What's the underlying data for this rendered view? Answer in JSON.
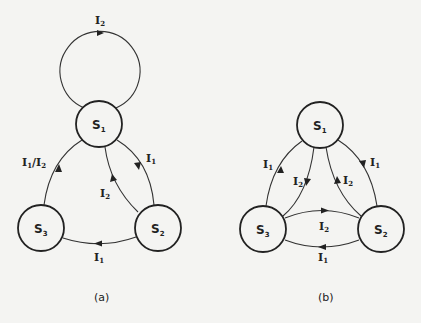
{
  "diagram_a": {
    "caption": "(a)",
    "states": [
      {
        "id": "S1",
        "base": "S",
        "sub": "1"
      },
      {
        "id": "S2",
        "base": "S",
        "sub": "2"
      },
      {
        "id": "S3",
        "base": "S",
        "sub": "3"
      }
    ],
    "transitions": [
      {
        "from": "S1",
        "to": "S1",
        "base": "I",
        "sub": "2",
        "label": "I2"
      },
      {
        "from": "S3",
        "to": "S1",
        "label": "I1/I2",
        "parts": [
          "I",
          "1",
          "/",
          "I",
          "2"
        ]
      },
      {
        "from": "S1",
        "to": "S2",
        "base": "I",
        "sub": "1",
        "label": "I1"
      },
      {
        "from": "S2",
        "to": "S1",
        "base": "I",
        "sub": "2",
        "label": "I2"
      },
      {
        "from": "S2",
        "to": "S3",
        "base": "I",
        "sub": "1",
        "label": "I1"
      }
    ]
  },
  "diagram_b": {
    "caption": "(b)",
    "states": [
      {
        "id": "S1",
        "base": "S",
        "sub": "1"
      },
      {
        "id": "S2",
        "base": "S",
        "sub": "2"
      },
      {
        "id": "S3",
        "base": "S",
        "sub": "3"
      }
    ],
    "transitions": [
      {
        "from": "S3",
        "to": "S1",
        "base": "I",
        "sub": "1",
        "label": "I1"
      },
      {
        "from": "S1",
        "to": "S3",
        "base": "I",
        "sub": "2",
        "label": "I2"
      },
      {
        "from": "S2",
        "to": "S1",
        "base": "I",
        "sub": "2",
        "label": "I2"
      },
      {
        "from": "S1",
        "to": "S2",
        "base": "I",
        "sub": "1",
        "label": "I1"
      },
      {
        "from": "S3",
        "to": "S2",
        "base": "I",
        "sub": "2",
        "label": "I2"
      },
      {
        "from": "S2",
        "to": "S3",
        "base": "I",
        "sub": "1",
        "label": "I1"
      }
    ]
  }
}
